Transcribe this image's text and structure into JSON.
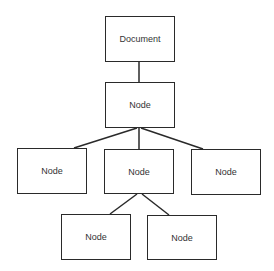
{
  "diagram": {
    "type": "tree",
    "nodes": [
      {
        "id": "document",
        "label": "Document",
        "x": 105,
        "y": 16,
        "w": 70,
        "h": 46
      },
      {
        "id": "root-node",
        "label": "Node",
        "x": 105,
        "y": 82,
        "w": 70,
        "h": 46
      },
      {
        "id": "child-left",
        "label": "Node",
        "x": 17,
        "y": 148,
        "w": 70,
        "h": 46
      },
      {
        "id": "child-middle",
        "label": "Node",
        "x": 104,
        "y": 149,
        "w": 70,
        "h": 45
      },
      {
        "id": "child-right",
        "label": "Node",
        "x": 191,
        "y": 149,
        "w": 70,
        "h": 46
      },
      {
        "id": "grandchild-left",
        "label": "Node",
        "x": 61,
        "y": 214,
        "w": 70,
        "h": 46
      },
      {
        "id": "grandchild-right",
        "label": "Node",
        "x": 147,
        "y": 215,
        "w": 70,
        "h": 45
      }
    ],
    "edges": [
      {
        "from": "document",
        "to": "root-node"
      },
      {
        "from": "root-node",
        "to": "child-left"
      },
      {
        "from": "root-node",
        "to": "child-middle"
      },
      {
        "from": "root-node",
        "to": "child-right"
      },
      {
        "from": "child-middle",
        "to": "grandchild-left"
      },
      {
        "from": "child-middle",
        "to": "grandchild-right"
      }
    ],
    "colors": {
      "stroke": "#2a2a2a",
      "text": "#333333",
      "background": "#ffffff"
    }
  }
}
